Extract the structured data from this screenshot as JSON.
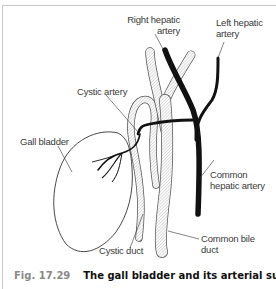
{
  "figure": {
    "number": "Fig. 17.29",
    "title": "The gall bladder and its arterial supply."
  },
  "labels": {
    "right_hepatic_artery": [
      "Right hepatic",
      "artery"
    ],
    "left_hepatic_artery": [
      "Left hepatic",
      "artery"
    ],
    "cystic_artery": "Cystic artery",
    "gall_bladder": "Gall bladder",
    "common_hepatic_artery": [
      "Common",
      "hepatic artery"
    ],
    "cystic_duct": "Cystic duct",
    "common_bile_duct": [
      "Common bile",
      "duct"
    ]
  },
  "colors": {
    "artery": "#111111",
    "outline": "#333333",
    "duct_fill": "#f4f4f4",
    "duct_hatch": "#b5b5b5",
    "frame": "#c8c8c8",
    "figure_number": "#8a8a8a",
    "figure_title": "#111111"
  }
}
